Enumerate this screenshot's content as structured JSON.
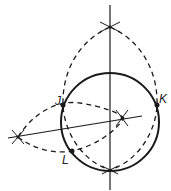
{
  "diagram": {
    "type": "geometric-construction",
    "labels": {
      "J": "J",
      "K": "K",
      "L": "L"
    },
    "colors": {
      "stroke": "#1a1a1a",
      "background": "#ffffff"
    }
  }
}
